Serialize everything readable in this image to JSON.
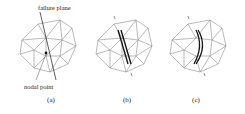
{
  "panels": [
    {
      "id": "a",
      "caption": "(a)"
    },
    {
      "id": "b",
      "caption": "(b)"
    },
    {
      "id": "c",
      "caption": "(c)"
    }
  ],
  "annotations": {
    "failure_plane": "failure plane",
    "nodal_point": "nodal point"
  },
  "colors": {
    "mesh": "#8a8a8a",
    "failure": "#1a1a1a",
    "text": "#222222"
  }
}
